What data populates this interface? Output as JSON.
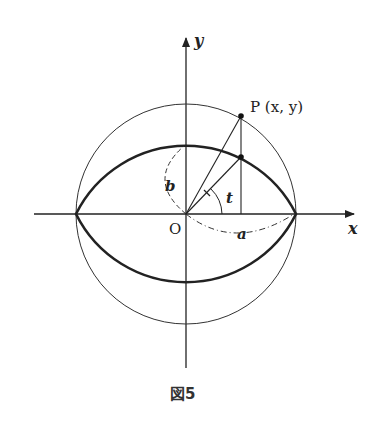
{
  "figure": {
    "caption": "図5",
    "axis_x_label": "x",
    "axis_y_label": "y",
    "origin_label": "O",
    "point_label": "P (x, y)",
    "semi_major_label": "a",
    "semi_minor_label": "b",
    "angle_label": "t"
  },
  "geometry": {
    "semi_major_a": 1.0,
    "semi_minor_b": 0.62,
    "parameter_t_deg": 55
  }
}
